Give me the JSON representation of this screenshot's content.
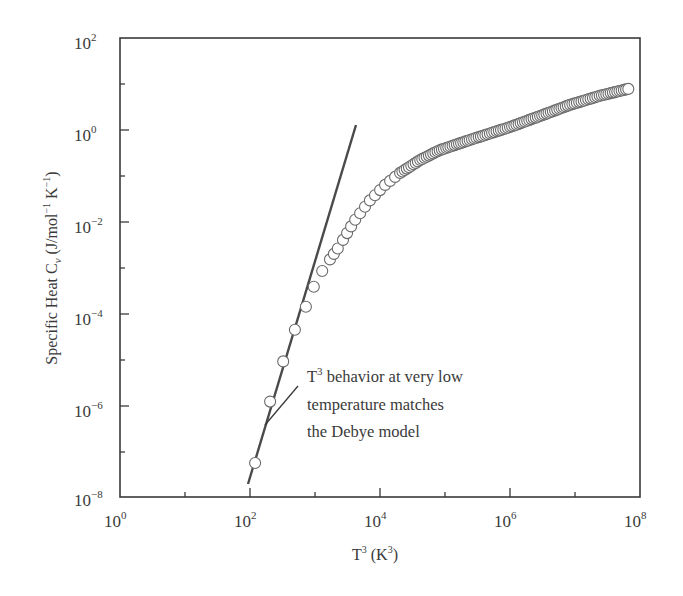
{
  "chart_data": {
    "type": "scatter",
    "title": "",
    "xlabel": "T^3 (K^3)",
    "ylabel": "Specific Heat C_v (J/mol^-1 K^-1)",
    "xscale": "log",
    "yscale": "log",
    "xlim": [
      1,
      100000000
    ],
    "ylim": [
      1e-08,
      100
    ],
    "grid": false,
    "legend": null,
    "x_ticks": [
      {
        "base": "10",
        "exp": "0",
        "value": 1
      },
      {
        "base": "10",
        "exp": "2",
        "value": 100
      },
      {
        "base": "10",
        "exp": "4",
        "value": 10000
      },
      {
        "base": "10",
        "exp": "6",
        "value": 1000000
      },
      {
        "base": "10",
        "exp": "8",
        "value": 100000000
      }
    ],
    "y_ticks": [
      {
        "base": "10",
        "exp": "−8",
        "value": 1e-08
      },
      {
        "base": "10",
        "exp": "−6",
        "value": 1e-06
      },
      {
        "base": "10",
        "exp": "−4",
        "value": 0.0001
      },
      {
        "base": "10",
        "exp": "−2",
        "value": 0.01
      },
      {
        "base": "10",
        "exp": "0",
        "value": 1
      },
      {
        "base": "10",
        "exp": "2",
        "value": 100
      }
    ],
    "series": [
      {
        "name": "Measured specific heat",
        "style": "open-circle",
        "x": [
          120,
          204,
          324,
          490,
          725,
          960,
          1290,
          1700,
          2240,
          2700,
          4150,
          7000,
          12000,
          20400,
          41500,
          83000,
          240000,
          1000000,
          2900000,
          8400000,
          24000000,
          66000000
        ],
        "y": [
          5.5e-08,
          1.2e-06,
          9e-06,
          4.4e-05,
          0.00014,
          0.00038,
          0.00084,
          0.0015,
          0.0026,
          0.004,
          0.011,
          0.029,
          0.063,
          0.115,
          0.22,
          0.36,
          0.6,
          1.15,
          2.0,
          3.5,
          5.5,
          7.8
        ],
        "dense": true
      },
      {
        "name": "T^3 Debye fit",
        "style": "solid-line",
        "x": [
          93,
          4300
        ],
        "y": [
          1.9e-08,
          1.26
        ]
      }
    ],
    "annotations": [
      {
        "lines": [
          "T³ behavior at very low",
          "temperature matches",
          "the Debye model"
        ],
        "points_to": {
          "x": 150,
          "y": 3e-07
        }
      }
    ]
  },
  "axes": {
    "x_title_main": "T",
    "x_title_sup": "3",
    "x_title_rest": " (K",
    "x_title_sup2": "3",
    "x_title_end": ")",
    "y_title": "Specific Heat C",
    "y_title_sub": "v",
    "y_title_rest": " (J/mol",
    "y_title_sup": "−1",
    "y_title_rest2": " K",
    "y_title_sup2": "−1",
    "y_title_end": ")"
  },
  "annotation": {
    "line1_T": "T",
    "line1_sup": "3",
    "line1_rest": " behavior at very low",
    "line2": "temperature matches",
    "line3": "the Debye model"
  },
  "colors": {
    "axis": "#3a3a3a",
    "line": "#4a4a4a",
    "marker_stroke": "#6a6a6a",
    "marker_fill": "#ffffff"
  }
}
